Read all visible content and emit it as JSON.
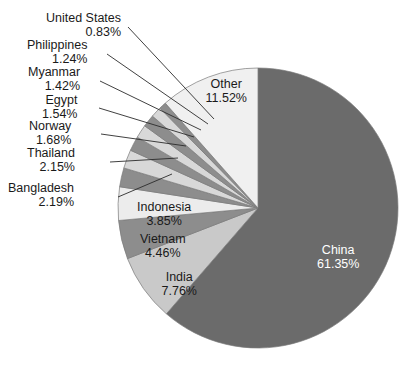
{
  "chart_data": {
    "type": "pie",
    "title": "",
    "subtitle": "",
    "xlabel": "",
    "ylabel": "",
    "legend_position": "none",
    "grid": false,
    "units": "percent",
    "start_angle_deg": 0,
    "direction": "clockwise",
    "categories": [
      "China",
      "India",
      "Vietnam",
      "Indonesia",
      "Bangladesh",
      "Thailand",
      "Norway",
      "Egypt",
      "Myanmar",
      "Philippines",
      "United States",
      "Other"
    ],
    "values": [
      61.35,
      7.76,
      4.46,
      3.85,
      2.19,
      2.15,
      1.68,
      1.54,
      1.42,
      1.24,
      0.83,
      11.52
    ],
    "slices": [
      {
        "name": "China",
        "value": 61.35,
        "pct_text": "61.35%",
        "color": "#6b6b6b",
        "label_placement": "inside",
        "label_color": "on-dark",
        "label_x": 338,
        "label_y": 243
      },
      {
        "name": "India",
        "value": 7.76,
        "pct_text": "7.76%",
        "color": "#c9c9c9",
        "label_placement": "inside",
        "label_color": "on-light",
        "label_x": 179,
        "label_y": 270
      },
      {
        "name": "Vietnam",
        "value": 4.46,
        "pct_text": "4.46%",
        "color": "#8d8d8d",
        "label_placement": "inside",
        "label_color": "on-light",
        "label_x": 163,
        "label_y": 232
      },
      {
        "name": "Indonesia",
        "value": 3.85,
        "pct_text": "3.85%",
        "color": "#ececec",
        "label_placement": "inside",
        "label_color": "on-light",
        "label_x": 164,
        "label_y": 200
      },
      {
        "name": "Bangladesh",
        "value": 2.19,
        "pct_text": "2.19%",
        "color": "#8d8d8d",
        "label_placement": "callout",
        "label_color": "on-light",
        "label_x": 8,
        "label_y": 181,
        "leader_from_x": 118,
        "leader_from_y": 197,
        "leader_to_x": 172,
        "leader_to_y": 174
      },
      {
        "name": "Thailand",
        "value": 2.15,
        "pct_text": "2.15%",
        "color": "#d8d8d8",
        "label_placement": "callout",
        "label_color": "on-light",
        "label_x": 27,
        "label_y": 146,
        "leader_from_x": 110,
        "leader_from_y": 162,
        "leader_to_x": 178,
        "leader_to_y": 158
      },
      {
        "name": "Norway",
        "value": 1.68,
        "pct_text": "1.68%",
        "color": "#8d8d8d",
        "label_placement": "callout",
        "label_color": "on-light",
        "label_x": 29,
        "label_y": 119,
        "leader_from_x": 101,
        "leader_from_y": 134,
        "leader_to_x": 186,
        "leader_to_y": 146
      },
      {
        "name": "Egypt",
        "value": 1.54,
        "pct_text": "1.54%",
        "color": "#d8d8d8",
        "label_placement": "callout",
        "label_color": "on-light",
        "label_x": 42,
        "label_y": 93,
        "leader_from_x": 99,
        "leader_from_y": 108,
        "leader_to_x": 194,
        "leader_to_y": 137
      },
      {
        "name": "Myanmar",
        "value": 1.42,
        "pct_text": "1.42%",
        "color": "#8d8d8d",
        "label_placement": "callout",
        "label_color": "on-light",
        "label_x": 28,
        "label_y": 65,
        "leader_from_x": 100,
        "leader_from_y": 81,
        "leader_to_x": 201,
        "leader_to_y": 130
      },
      {
        "name": "Philippines",
        "value": 1.24,
        "pct_text": "1.24%",
        "color": "#d8d8d8",
        "label_placement": "callout",
        "label_color": "on-light",
        "label_x": 27,
        "label_y": 38,
        "leader_from_x": 107,
        "leader_from_y": 54,
        "leader_to_x": 208,
        "leader_to_y": 124
      },
      {
        "name": "United States",
        "value": 0.83,
        "pct_text": "0.83%",
        "color": "#8d8d8d",
        "label_placement": "callout",
        "label_color": "on-light",
        "label_x": 46,
        "label_y": 11,
        "leader_from_x": 128,
        "leader_from_y": 27,
        "leader_to_x": 214,
        "leader_to_y": 119
      },
      {
        "name": "Other",
        "value": 11.52,
        "pct_text": "11.52%",
        "color": "#f0f0f0",
        "label_placement": "inside",
        "label_color": "on-light",
        "label_x": 226,
        "label_y": 77
      }
    ],
    "geometry": {
      "center_x": 258,
      "center_y": 208,
      "radius": 140
    },
    "palette": {
      "dark_gray": "#6b6b6b",
      "medium_gray": "#8d8d8d",
      "light_gray": "#c9c9c9",
      "pale_gray": "#d8d8d8",
      "near_white": "#f0f0f0",
      "outline": "#7a7a7a",
      "leader_line": "#2b2b2b",
      "text": "#1a1a1a",
      "text_on_dark": "#ffffff"
    }
  }
}
